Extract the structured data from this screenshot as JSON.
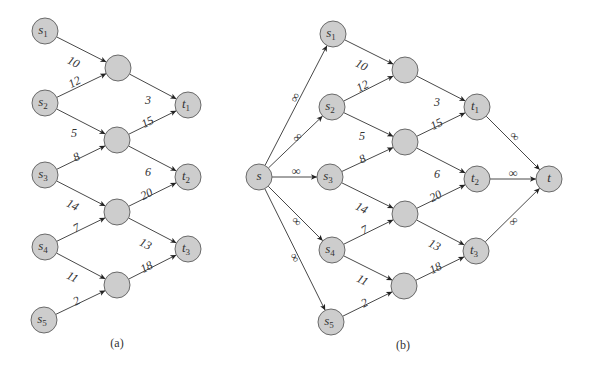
{
  "figure": {
    "panels": [
      {
        "id": "a",
        "caption": "(a)",
        "caption_pos": [
          117,
          347
        ],
        "nodes": [
          {
            "id": "s1",
            "label": "s",
            "sub": "1",
            "x": 45,
            "y": 31
          },
          {
            "id": "s2",
            "label": "s",
            "sub": "2",
            "x": 45,
            "y": 103
          },
          {
            "id": "s3",
            "label": "s",
            "sub": "3",
            "x": 45,
            "y": 175
          },
          {
            "id": "s4",
            "label": "s",
            "sub": "4",
            "x": 45,
            "y": 247
          },
          {
            "id": "s5",
            "label": "s",
            "sub": "5",
            "x": 44,
            "y": 320
          },
          {
            "id": "m1",
            "label": "",
            "sub": "",
            "x": 118,
            "y": 68
          },
          {
            "id": "m2",
            "label": "",
            "sub": "",
            "x": 117,
            "y": 140
          },
          {
            "id": "m3",
            "label": "",
            "sub": "",
            "x": 117,
            "y": 212
          },
          {
            "id": "m4",
            "label": "",
            "sub": "",
            "x": 117,
            "y": 285
          },
          {
            "id": "t1",
            "label": "t",
            "sub": "1",
            "x": 188,
            "y": 105
          },
          {
            "id": "t2",
            "label": "t",
            "sub": "2",
            "x": 188,
            "y": 177
          },
          {
            "id": "t3",
            "label": "t",
            "sub": "3",
            "x": 188,
            "y": 249
          }
        ],
        "edges": [
          {
            "from": "s1",
            "to": "m1",
            "label": "10",
            "lx": 73,
            "ly": 63,
            "rot": 27
          },
          {
            "from": "s2",
            "to": "m1",
            "label": "12",
            "lx": 75,
            "ly": 83,
            "rot": -27
          },
          {
            "from": "s2",
            "to": "m2",
            "label": "5",
            "lx": 74,
            "ly": 134,
            "rot": 0
          },
          {
            "from": "s3",
            "to": "m2",
            "label": "8",
            "lx": 77,
            "ly": 158,
            "rot": -27
          },
          {
            "from": "s3",
            "to": "m3",
            "label": "14",
            "lx": 72,
            "ly": 206,
            "rot": 27
          },
          {
            "from": "s4",
            "to": "m3",
            "label": "7",
            "lx": 77,
            "ly": 229,
            "rot": -27
          },
          {
            "from": "s4",
            "to": "m4",
            "label": "11",
            "lx": 72,
            "ly": 278,
            "rot": 27
          },
          {
            "from": "s5",
            "to": "m4",
            "label": "2",
            "lx": 77,
            "ly": 302,
            "rot": -27
          },
          {
            "from": "m1",
            "to": "t1",
            "label": "3",
            "lx": 148,
            "ly": 101,
            "rot": 0
          },
          {
            "from": "m2",
            "to": "t1",
            "label": "15",
            "lx": 148,
            "ly": 123,
            "rot": -27
          },
          {
            "from": "m2",
            "to": "t2",
            "label": "6",
            "lx": 148,
            "ly": 173,
            "rot": 0
          },
          {
            "from": "m3",
            "to": "t2",
            "label": "20",
            "lx": 147,
            "ly": 195,
            "rot": -27
          },
          {
            "from": "m3",
            "to": "t3",
            "label": "13",
            "lx": 145,
            "ly": 245,
            "rot": 27
          },
          {
            "from": "m4",
            "to": "t3",
            "label": "18",
            "lx": 147,
            "ly": 268,
            "rot": -27
          }
        ]
      },
      {
        "id": "b",
        "caption": "(b)",
        "caption_pos": [
          403,
          349
        ],
        "nodes": [
          {
            "id": "s",
            "label": "s",
            "sub": "",
            "x": 259,
            "y": 177
          },
          {
            "id": "s1",
            "label": "s",
            "sub": "1",
            "x": 333,
            "y": 34
          },
          {
            "id": "s2",
            "label": "s",
            "sub": "2",
            "x": 332,
            "y": 107
          },
          {
            "id": "s3",
            "label": "s",
            "sub": "3",
            "x": 330,
            "y": 177
          },
          {
            "id": "s4",
            "label": "s",
            "sub": "4",
            "x": 332,
            "y": 250
          },
          {
            "id": "s5",
            "label": "s",
            "sub": "5",
            "x": 331,
            "y": 322
          },
          {
            "id": "m1",
            "label": "",
            "sub": "",
            "x": 405,
            "y": 70
          },
          {
            "id": "m2",
            "label": "",
            "sub": "",
            "x": 405,
            "y": 142
          },
          {
            "id": "m3",
            "label": "",
            "sub": "",
            "x": 405,
            "y": 214
          },
          {
            "id": "m4",
            "label": "",
            "sub": "",
            "x": 404,
            "y": 286
          },
          {
            "id": "t1",
            "label": "t",
            "sub": "1",
            "x": 477,
            "y": 107
          },
          {
            "id": "t2",
            "label": "t",
            "sub": "2",
            "x": 477,
            "y": 179
          },
          {
            "id": "t3",
            "label": "t",
            "sub": "3",
            "x": 476,
            "y": 251
          },
          {
            "id": "t",
            "label": "t",
            "sub": "",
            "x": 549,
            "y": 179
          }
        ],
        "edges": [
          {
            "from": "s",
            "to": "s1",
            "label": "∞",
            "lx": 296,
            "ly": 98,
            "rot": -63
          },
          {
            "from": "s",
            "to": "s2",
            "label": "∞",
            "lx": 298,
            "ly": 138,
            "rot": -45
          },
          {
            "from": "s",
            "to": "s3",
            "label": "∞",
            "lx": 296,
            "ly": 172,
            "rot": 0
          },
          {
            "from": "s",
            "to": "s4",
            "label": "∞",
            "lx": 296,
            "ly": 222,
            "rot": 45
          },
          {
            "from": "s",
            "to": "s5",
            "label": "∞",
            "lx": 294,
            "ly": 258,
            "rot": 63
          },
          {
            "from": "s1",
            "to": "m1",
            "label": "10",
            "lx": 361,
            "ly": 66,
            "rot": 27
          },
          {
            "from": "s2",
            "to": "m1",
            "label": "12",
            "lx": 363,
            "ly": 87,
            "rot": -27
          },
          {
            "from": "s2",
            "to": "m2",
            "label": "5",
            "lx": 362,
            "ly": 137,
            "rot": 0
          },
          {
            "from": "s3",
            "to": "m2",
            "label": "8",
            "lx": 363,
            "ly": 160,
            "rot": -27
          },
          {
            "from": "s3",
            "to": "m3",
            "label": "14",
            "lx": 361,
            "ly": 209,
            "rot": 27
          },
          {
            "from": "s4",
            "to": "m3",
            "label": "7",
            "lx": 365,
            "ly": 231,
            "rot": -27
          },
          {
            "from": "s4",
            "to": "m4",
            "label": "11",
            "lx": 362,
            "ly": 281,
            "rot": 27
          },
          {
            "from": "s5",
            "to": "m4",
            "label": "2",
            "lx": 365,
            "ly": 304,
            "rot": -27
          },
          {
            "from": "m1",
            "to": "t1",
            "label": "3",
            "lx": 437,
            "ly": 103,
            "rot": 0
          },
          {
            "from": "m2",
            "to": "t1",
            "label": "15",
            "lx": 437,
            "ly": 125,
            "rot": -27
          },
          {
            "from": "m2",
            "to": "t2",
            "label": "6",
            "lx": 437,
            "ly": 175,
            "rot": 0
          },
          {
            "from": "m3",
            "to": "t2",
            "label": "20",
            "lx": 436,
            "ly": 197,
            "rot": -27
          },
          {
            "from": "m3",
            "to": "t3",
            "label": "13",
            "lx": 434,
            "ly": 246,
            "rot": 27
          },
          {
            "from": "m4",
            "to": "t3",
            "label": "18",
            "lx": 436,
            "ly": 269,
            "rot": -27
          },
          {
            "from": "t1",
            "to": "t",
            "label": "∞",
            "lx": 514,
            "ly": 137,
            "rot": 45
          },
          {
            "from": "t2",
            "to": "t",
            "label": "∞",
            "lx": 513,
            "ly": 174,
            "rot": 0
          },
          {
            "from": "t3",
            "to": "t",
            "label": "∞",
            "lx": 514,
            "ly": 222,
            "rot": -45
          }
        ]
      }
    ]
  }
}
